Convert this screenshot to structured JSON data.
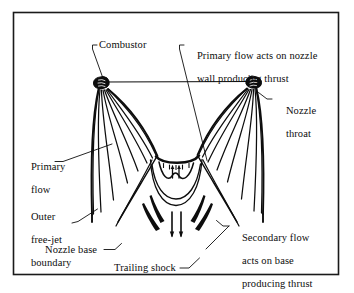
{
  "figure": {
    "type": "technical-line-diagram",
    "border_color": "#1a1a1a",
    "ink_color": "#0d0d0d",
    "background": "#ffffff",
    "labels": [
      {
        "id": "combustor",
        "text": "Combustor",
        "lines": [
          "Combustor"
        ]
      },
      {
        "id": "primary-wall-thrust",
        "text": "Primary flow acts on nozzle wall producing thrust",
        "lines": [
          "Primary flow acts on nozzle",
          "wall producing thrust"
        ]
      },
      {
        "id": "nozzle-throat",
        "text": "Nozzle throat",
        "lines": [
          "Nozzle",
          "throat"
        ]
      },
      {
        "id": "primary-flow",
        "text": "Primary flow",
        "lines": [
          "Primary",
          "flow"
        ]
      },
      {
        "id": "outer-free-jet",
        "text": "Outer free-jet boundary",
        "lines": [
          "Outer",
          "free-jet",
          "boundary"
        ]
      },
      {
        "id": "nozzle-base",
        "text": "Nozzle base",
        "lines": [
          "Nozzle base"
        ]
      },
      {
        "id": "trailing-shock",
        "text": "Trailing shock",
        "lines": [
          "Trailing shock"
        ]
      },
      {
        "id": "secondary-base-thrust",
        "text": "Secondary flow acts on base producing thrust",
        "lines": [
          "Secondary flow",
          "acts on base",
          "producing thrust"
        ]
      }
    ],
    "elements": {
      "combustor_left": "combustor-block-left",
      "combustor_right": "combustor-block-right",
      "primary_streamlines": "fan-of-expansion-streamlines",
      "base_arc": "nozzle-base-curved-arc",
      "base_arrows_up": "secondary-flow-up-arrows",
      "recirculation": "recirculation-curves",
      "trailing_shocks": "trailing-shock-wedges",
      "exhaust_arrows_down": "downstream-flow-arrows"
    }
  }
}
